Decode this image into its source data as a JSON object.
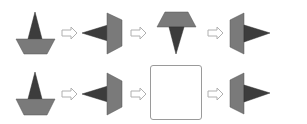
{
  "puzzle": {
    "type": "shape-rotation-sequence",
    "colors": {
      "dark_triangle": "#3c3c3c",
      "light_trapezoid": "#7a7a7a",
      "outline": "#555555",
      "arrow_outline": "#b0b0b0",
      "answer_box_border": "#9a9a9a"
    },
    "rows": [
      {
        "index": 1,
        "items": [
          {
            "kind": "shape",
            "name": "triangle-up-on-trapezoid"
          },
          {
            "kind": "arrow",
            "direction": "right"
          },
          {
            "kind": "shape",
            "name": "triangle-left-with-vertical-trapezoid"
          },
          {
            "kind": "arrow",
            "direction": "right"
          },
          {
            "kind": "shape",
            "name": "trapezoid-top-with-triangle-down"
          },
          {
            "kind": "arrow",
            "direction": "right"
          },
          {
            "kind": "shape",
            "name": "vertical-trapezoid-with-triangle-right"
          }
        ]
      },
      {
        "index": 2,
        "items": [
          {
            "kind": "shape",
            "name": "triangle-up-on-trapezoid"
          },
          {
            "kind": "arrow",
            "direction": "right"
          },
          {
            "kind": "shape",
            "name": "triangle-left-with-vertical-trapezoid"
          },
          {
            "kind": "arrow",
            "direction": "right"
          },
          {
            "kind": "blank",
            "name": "answer-box"
          },
          {
            "kind": "arrow",
            "direction": "right"
          },
          {
            "kind": "shape",
            "name": "vertical-trapezoid-with-triangle-right"
          }
        ]
      }
    ]
  }
}
